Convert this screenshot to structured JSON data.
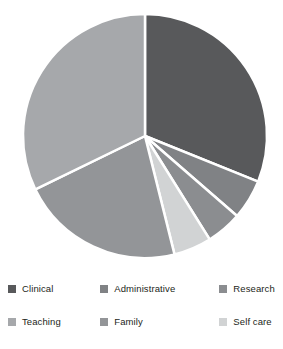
{
  "chart_data": {
    "type": "pie",
    "title": "",
    "subtitle": "",
    "xlabel": "",
    "ylabel": "",
    "legend_position": "bottom",
    "grid": false,
    "start_angle_deg": 0,
    "direction": "clockwise",
    "categories": [
      "Clinical",
      "Administrative",
      "Research",
      "Teaching",
      "Family",
      "Self care"
    ],
    "values": [
      31,
      5,
      5,
      32,
      22,
      5
    ],
    "slices": [
      {
        "label": "Clinical",
        "value": 31,
        "color": "#58595b",
        "start_deg": 0,
        "end_deg": 112
      },
      {
        "label": "Administrative",
        "value": 5,
        "color": "#808285",
        "start_deg": 112,
        "end_deg": 131
      },
      {
        "label": "Research",
        "value": 5,
        "color": "#8b8d90",
        "start_deg": 131,
        "end_deg": 148
      },
      {
        "label": "Self care",
        "value": 5,
        "color": "#d1d3d4",
        "start_deg": 148,
        "end_deg": 166
      },
      {
        "label": "Family",
        "value": 22,
        "color": "#939598",
        "start_deg": 166,
        "end_deg": 244
      },
      {
        "label": "Teaching",
        "value": 32,
        "color": "#a6a8ab",
        "start_deg": 244,
        "end_deg": 360
      }
    ],
    "geometry": {
      "cx": 145,
      "cy": 136,
      "r": 122,
      "separator_color": "#ffffff",
      "separator_width": 2.5
    }
  },
  "legend": {
    "rows": [
      [
        {
          "label": "Clinical",
          "color": "#58595b"
        },
        {
          "label": "Administrative",
          "color": "#808285"
        },
        {
          "label": "Research",
          "color": "#8b8d90"
        }
      ],
      [
        {
          "label": "Teaching",
          "color": "#a6a8ab"
        },
        {
          "label": "Family",
          "color": "#939598"
        },
        {
          "label": "Self care",
          "color": "#d1d3d4"
        }
      ]
    ]
  }
}
